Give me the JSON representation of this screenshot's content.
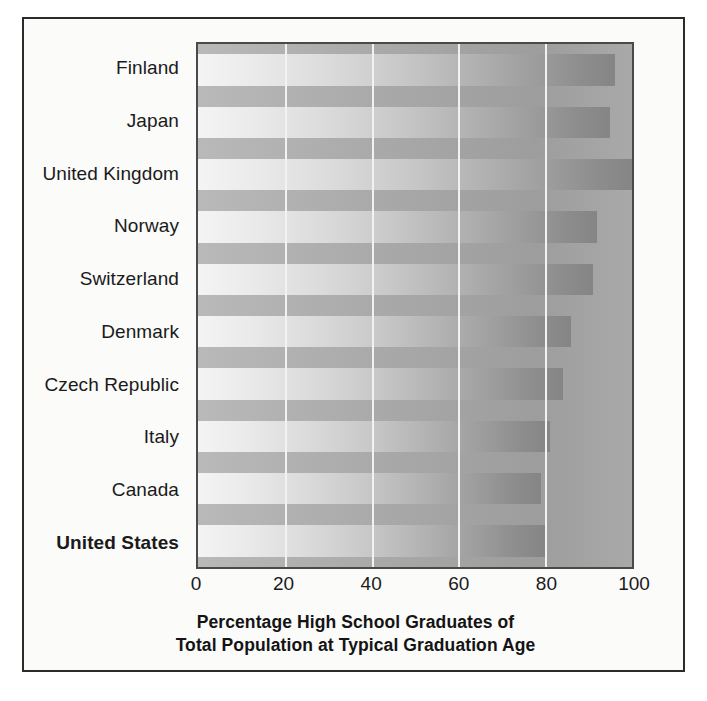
{
  "chart_data": {
    "type": "bar",
    "orientation": "horizontal",
    "title": "",
    "xlabel": "Percentage High School Graduates of Total Population at Typical Graduation Age",
    "ylabel": "",
    "categories": [
      "Finland",
      "Japan",
      "United Kingdom",
      "Norway",
      "Switzerland",
      "Denmark",
      "Czech Republic",
      "Italy",
      "Canada",
      "United States"
    ],
    "values": [
      96,
      95,
      100,
      92,
      91,
      86,
      84,
      81,
      79,
      80
    ],
    "highlighted_category": "United States",
    "xlim": [
      0,
      100
    ],
    "xticks": [
      0,
      20,
      40,
      60,
      80,
      100
    ],
    "xtick_labels": [
      "0",
      "20",
      "40",
      "60",
      "80",
      "100"
    ],
    "gridlines": [
      20,
      40,
      60,
      80
    ],
    "grid": true,
    "legend": false,
    "bar_style": "light-to-dark horizontal gradient on gray plot background"
  },
  "axis_title": {
    "line1": "Percentage High School Graduates of",
    "line2": "Total Population at Typical Graduation Age"
  },
  "colors": {
    "plot_background": "#a8a8a8",
    "page_background": "#fbfbfa",
    "frame_border": "#2b2b2b",
    "axis_border": "#4a4a4a",
    "gridline": "#f2f2f2",
    "bar_light": "#f4f4f4",
    "bar_dark": "#858585",
    "text": "#1a1a1a"
  }
}
